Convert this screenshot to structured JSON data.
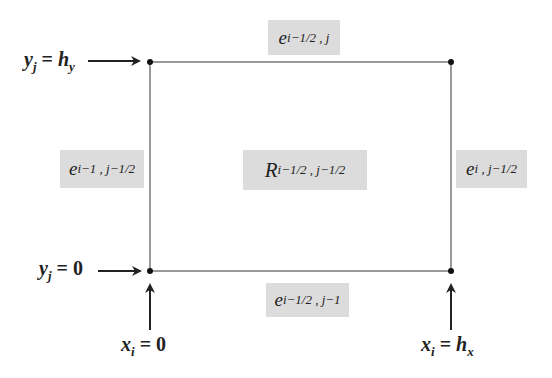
{
  "diagram": {
    "cell": {
      "label_main": "R",
      "label_sub": "i−1/2 , j−1/2"
    },
    "edges": {
      "top": {
        "main": "e",
        "sub": "i−1/2 , j"
      },
      "bottom": {
        "main": "e",
        "sub": "i−1/2 , j−1"
      },
      "left": {
        "main": "e",
        "sub": "i−1 , j−1/2"
      },
      "right": {
        "main": "e",
        "sub": "i , j−1/2"
      }
    },
    "annotations": {
      "y_top": {
        "var": "y",
        "sub": "j",
        "eq": " = ",
        "val": "h",
        "valsub": "y"
      },
      "y_bottom": {
        "var": "y",
        "sub": "j",
        "eq": " = ",
        "val": "0"
      },
      "x_left": {
        "var": "x",
        "sub": "i",
        "eq": " = ",
        "val": "0"
      },
      "x_right": {
        "var": "x",
        "sub": "i",
        "eq": " = ",
        "val": "h",
        "valsub": "x"
      }
    },
    "colors": {
      "line": "#555555",
      "box": "#dcdcdc",
      "point": "#111111"
    }
  }
}
